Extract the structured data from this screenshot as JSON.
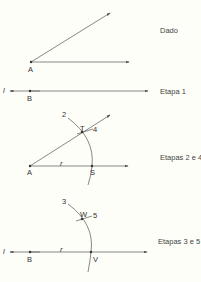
{
  "steps": {
    "given": "Dado",
    "step1": "Etapa 1",
    "steps24": "Etapas 2 e 4",
    "steps35": "Etapas 3 e 5"
  },
  "points": {
    "A1": "A",
    "B1": "B",
    "l1": "l",
    "A2": "A",
    "S": "S",
    "T": "T",
    "r1": "r",
    "n2": "2",
    "n4": "4",
    "B2": "B",
    "V": "V",
    "W": "W",
    "r2": "r",
    "n3": "3",
    "n5": "5",
    "l2": "l"
  },
  "colors": {
    "line": "#555555",
    "text": "#444444",
    "background": "#fefef8"
  }
}
